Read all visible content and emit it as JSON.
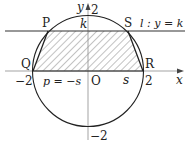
{
  "diagram": {
    "labels": {
      "P": "P",
      "Q": "Q",
      "R": "R",
      "S": "S",
      "O": "O",
      "k": "k",
      "line_l": "l : y = k",
      "x_axis": "x",
      "y_axis": "y",
      "y_top": "2",
      "y_bottom": "−2",
      "x_left": "−2",
      "x_right": "2",
      "p_eq": "p = −s",
      "s": "s"
    },
    "colors": {
      "stroke": "#222222",
      "axis": "#888888",
      "hatch": "#555555"
    }
  }
}
